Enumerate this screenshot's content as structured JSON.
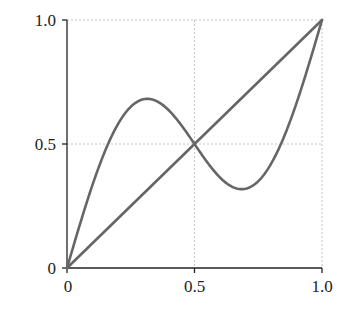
{
  "chart_data": {
    "type": "line",
    "title": "",
    "xlabel": "",
    "ylabel": "",
    "xlim": [
      0,
      1
    ],
    "ylim": [
      0,
      1
    ],
    "grid": true,
    "x_ticks": [
      "0",
      "0.5",
      "1.0"
    ],
    "y_ticks": [
      "0",
      "0.5",
      "1.0"
    ],
    "series": [
      {
        "name": "identity",
        "x": [
          0,
          0.5,
          1.0
        ],
        "y": [
          0,
          0.5,
          1.0
        ]
      },
      {
        "name": "x + 0.4·sin(2πx)",
        "x": [
          0,
          0.1,
          0.2,
          0.315,
          0.4,
          0.5,
          0.6,
          0.685,
          0.8,
          0.9,
          1.0
        ],
        "y": [
          0,
          0.335,
          0.58,
          0.68,
          0.635,
          0.5,
          0.365,
          0.32,
          0.42,
          0.665,
          1.0
        ]
      }
    ],
    "colors": {
      "curve": "#666666",
      "axis": "#222222",
      "grid": "#bbbbbb"
    }
  }
}
